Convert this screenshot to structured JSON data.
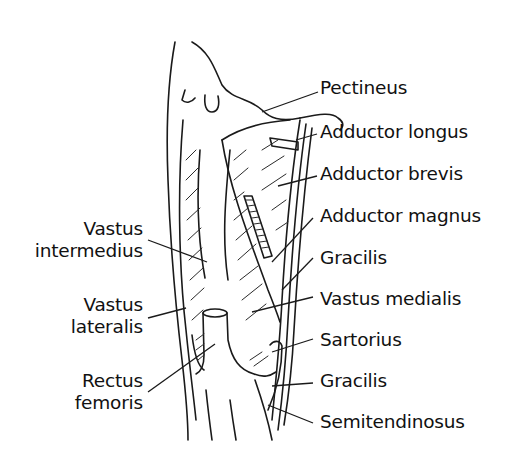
{
  "figure": {
    "labels_right": [
      {
        "id": "pectineus",
        "text": "Pectineus"
      },
      {
        "id": "adductor-longus",
        "text": "Adductor longus"
      },
      {
        "id": "adductor-brevis",
        "text": "Adductor brevis"
      },
      {
        "id": "adductor-magnus",
        "text": "Adductor magnus"
      },
      {
        "id": "gracilis-upper",
        "text": "Gracilis"
      },
      {
        "id": "vastus-medialis",
        "text": "Vastus medialis"
      },
      {
        "id": "sartorius",
        "text": "Sartorius"
      },
      {
        "id": "gracilis-lower",
        "text": "Gracilis"
      },
      {
        "id": "semitendinosus",
        "text": "Semitendinosus"
      }
    ],
    "labels_left": [
      {
        "id": "vastus-intermedius",
        "line1": "Vastus",
        "line2": "intermedius"
      },
      {
        "id": "vastus-lateralis",
        "line1": "Vastus",
        "line2": "lateralis"
      },
      {
        "id": "rectus-femoris",
        "line1": "Rectus",
        "line2": "femoris"
      }
    ]
  }
}
